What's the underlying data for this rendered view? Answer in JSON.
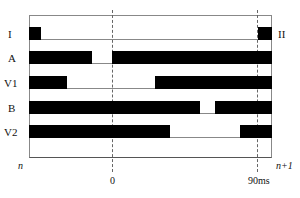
{
  "diagram": {
    "left_labels": [
      "I",
      "A",
      "V1",
      "B",
      "V2"
    ],
    "right_label": "II",
    "bottom_left": "n",
    "bottom_right": "n+1",
    "axis_ticks": [
      "0",
      "90ms"
    ]
  },
  "lanes": [
    {
      "name": "I",
      "top": 27,
      "height": 13,
      "bars": [
        [
          0,
          12
        ],
        [
          229,
          243
        ]
      ]
    },
    {
      "name": "A",
      "top": 51,
      "height": 13,
      "bars": [
        [
          0,
          63
        ],
        [
          83,
          243
        ]
      ]
    },
    {
      "name": "V1",
      "top": 76,
      "height": 13,
      "bars": [
        [
          0,
          38
        ],
        [
          126,
          243
        ]
      ]
    },
    {
      "name": "B",
      "top": 101,
      "height": 13,
      "bars": [
        [
          0,
          171
        ],
        [
          186,
          243
        ]
      ]
    },
    {
      "name": "V2",
      "top": 125,
      "height": 13,
      "bars": [
        [
          0,
          141
        ],
        [
          211,
          243
        ]
      ]
    }
  ],
  "colors": {
    "bar": "#000000",
    "line": "#888888"
  }
}
